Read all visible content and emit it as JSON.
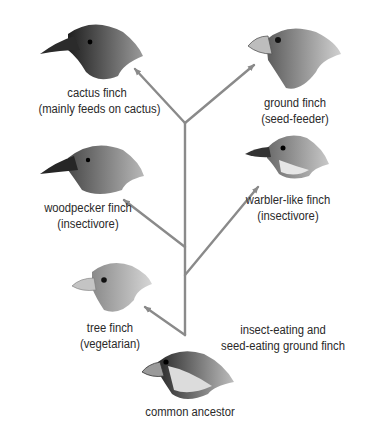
{
  "diagram": {
    "type": "evolutionary-tree",
    "line_color": "#8a8a8a",
    "nodes": [
      {
        "id": "cactus",
        "name": "cactus finch",
        "diet": "(mainly feeds on cactus)"
      },
      {
        "id": "ground",
        "name": "ground finch",
        "diet": "(seed-feeder)"
      },
      {
        "id": "woodpecker",
        "name": "woodpecker finch",
        "diet": "(insectivore)"
      },
      {
        "id": "warbler",
        "name": "warbler-like finch",
        "diet": "(insectivore)"
      },
      {
        "id": "tree",
        "name": "tree finch",
        "diet": "(vegetarian)"
      },
      {
        "id": "ancestor",
        "name": "common ancestor"
      }
    ],
    "annotation": {
      "line1": "insect-eating and",
      "line2": "seed-eating ground finch"
    }
  }
}
